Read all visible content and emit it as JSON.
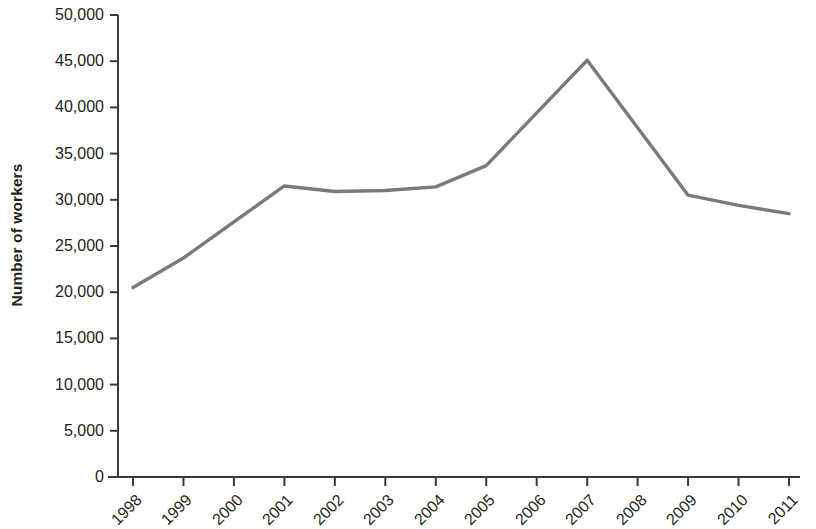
{
  "chart_data": {
    "type": "line",
    "title": "",
    "subtitle": "",
    "xlabel": "",
    "ylabel": "Number of workers",
    "categories": [
      "1998",
      "1999",
      "2000",
      "2001",
      "2002",
      "2003",
      "2004",
      "2005",
      "2006",
      "2007",
      "2008",
      "2009",
      "2010",
      "2011"
    ],
    "values": [
      20500,
      23700,
      27600,
      31500,
      30900,
      31000,
      31400,
      33700,
      39400,
      45100,
      37800,
      30500,
      29400,
      28500
    ],
    "series": [
      {
        "name": "Number of workers",
        "color": "#7a7a7a",
        "values": [
          20500,
          23700,
          27600,
          31500,
          30900,
          31000,
          31400,
          33700,
          39400,
          45100,
          37800,
          30500,
          29400,
          28500
        ]
      }
    ],
    "ylim": [
      0,
      50000
    ],
    "ytick_values": [
      0,
      5000,
      10000,
      15000,
      20000,
      25000,
      30000,
      35000,
      40000,
      45000,
      50000
    ],
    "ytick_labels": [
      "0",
      "5,000",
      "10,000",
      "15,000",
      "20,000",
      "25,000",
      "30,000",
      "35,000",
      "40,000",
      "45,000",
      "50,000"
    ],
    "grid": false,
    "legend": false,
    "legend_position": "none",
    "line_color": "#7a7a7a",
    "axis_color": "#3a3a3a",
    "markers": false,
    "xtick_rotation": -45
  },
  "axes": {
    "y_title": "Number of workers"
  }
}
